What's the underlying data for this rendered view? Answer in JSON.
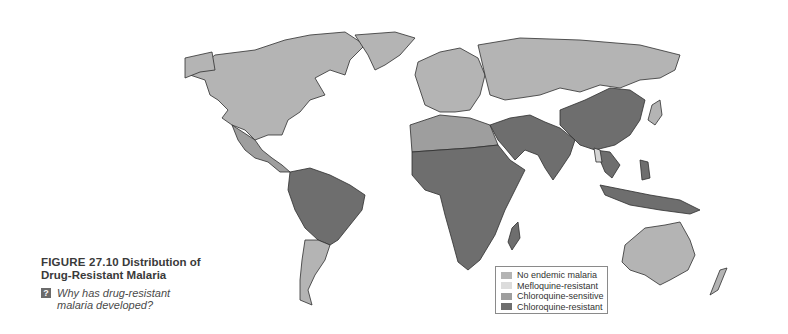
{
  "figure": {
    "number": "FIGURE 27.10",
    "title_part1": "Distribution of",
    "title_part2": "Drug-Resistant Malaria",
    "question_icon": "?",
    "question_text": "Why has drug-resistant malaria developed?"
  },
  "legend": {
    "items": [
      {
        "label": "No endemic malaria",
        "color": "#b4b4b4"
      },
      {
        "label": "Mefloquine-resistant",
        "color": "#dcdcdc"
      },
      {
        "label": "Chloroquine-sensitive",
        "color": "#9e9e9e"
      },
      {
        "label": "Chloroquine-resistant",
        "color": "#6e6e6e"
      }
    ]
  },
  "map": {
    "colors": {
      "no_endemic": "#b4b4b4",
      "mefloquine_resistant": "#d4d4d4",
      "chloroquine_sensitive": "#9e9e9e",
      "chloroquine_resistant": "#6e6e6e",
      "border": "#2e2e2e"
    }
  }
}
